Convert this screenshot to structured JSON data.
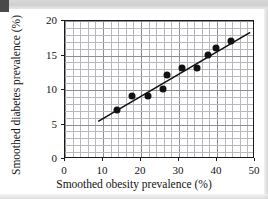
{
  "chart_data": {
    "type": "scatter",
    "title": "",
    "xlabel": "Smoothed obesity prevalence (%)",
    "ylabel": "Smoothed diabetes prevalence (%)",
    "xlim": [
      0,
      50
    ],
    "ylim": [
      0,
      20
    ],
    "xticks": [
      "0",
      "10",
      "20",
      "30",
      "40",
      "50"
    ],
    "xtick_values": [
      0,
      10,
      20,
      30,
      40,
      50
    ],
    "yticks": [
      "0",
      "5",
      "10",
      "15",
      "20"
    ],
    "ytick_values": [
      0,
      5,
      10,
      15,
      20
    ],
    "grid": true,
    "grid_minor_x_step": 2,
    "grid_minor_y_step": 1,
    "legend": "none",
    "marker_color": "#111111",
    "trendline_color": "#111111",
    "points": [
      {
        "x": 14,
        "y": 7
      },
      {
        "x": 18,
        "y": 9
      },
      {
        "x": 22,
        "y": 9
      },
      {
        "x": 26,
        "y": 10
      },
      {
        "x": 27,
        "y": 12
      },
      {
        "x": 31,
        "y": 13
      },
      {
        "x": 35,
        "y": 13
      },
      {
        "x": 38,
        "y": 15
      },
      {
        "x": 40,
        "y": 16
      },
      {
        "x": 44,
        "y": 17
      }
    ],
    "trendline": {
      "x0": 9,
      "y0": 5.3,
      "x1": 49,
      "y1": 18.2
    },
    "annotations": []
  },
  "figure": {
    "axis_color": "#1a1a1a",
    "grid_minor_color": "#b9b9bd",
    "grid_major_color": "#8d8d93",
    "background": "#ffffff"
  }
}
